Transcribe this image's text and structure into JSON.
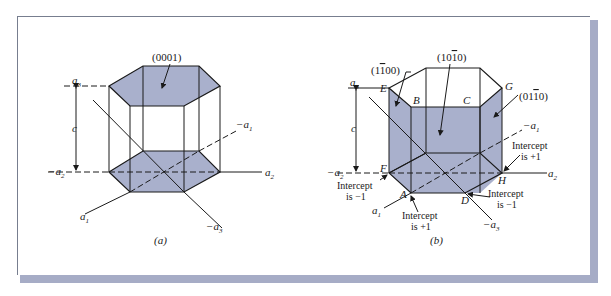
{
  "colors": {
    "face_fill": "#a9b0cc",
    "line": "#1a1a1a",
    "frame_shadow": "#a6acc6",
    "background": "#ffffff"
  },
  "panel_a": {
    "caption": "(a)",
    "plane_label": "(0001)",
    "axes": {
      "a1": "a",
      "a1_sub": "1",
      "neg_a1": "−a",
      "neg_a1_sub": "1",
      "a2": "a",
      "a2_sub": "2",
      "neg_a2": "−a",
      "neg_a2_sub": "2",
      "a3": "a",
      "a3_sub": "3",
      "neg_a3": "−a",
      "neg_a3_sub": "3",
      "c": "c"
    }
  },
  "panel_b": {
    "caption": "(b)",
    "plane_labels": {
      "p1": "(1",
      "p1_bar": "1",
      "p1_rest": "00)",
      "p2": "(10",
      "p2_bar": "1",
      "p2_rest": "0)",
      "p3": "(01",
      "p3_bar": "1",
      "p3_rest": "0)"
    },
    "vertices": {
      "E": "E",
      "B": "B",
      "C": "C",
      "G": "G",
      "F": "F",
      "A": "A",
      "D": "D",
      "H": "H"
    },
    "intercepts": {
      "F": [
        "Intercept",
        "is −1"
      ],
      "A": [
        "Intercept",
        "is +1"
      ],
      "D": [
        "Intercept",
        "is −1"
      ],
      "H": [
        "Intercept",
        "is +1"
      ]
    },
    "axes": {
      "a1": "a",
      "a1_sub": "1",
      "neg_a1": "−a",
      "neg_a1_sub": "1",
      "a2": "a",
      "a2_sub": "2",
      "neg_a2": "−a",
      "neg_a2_sub": "2",
      "a3": "a",
      "a3_sub": "3",
      "neg_a3": "−a",
      "neg_a3_sub": "3",
      "c": "c"
    }
  }
}
